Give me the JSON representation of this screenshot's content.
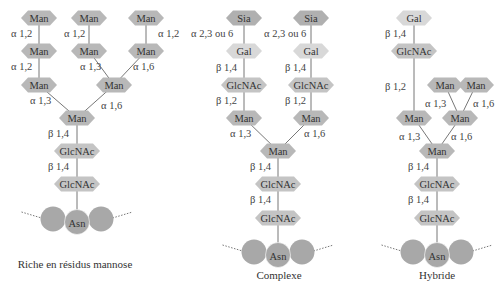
{
  "colors": {
    "man": "#b8b8b8",
    "glcnac": "#c4c4c4",
    "sia": "#b0b0b0",
    "gal": "#d8d8d8",
    "asn": "#a8a8a8",
    "bond": "#777777",
    "text": "#333333"
  },
  "panels": [
    {
      "caption": "Riche en résidus mannose",
      "caption_pos": [
        75,
        268
      ],
      "nodes": [
        {
          "id": "m1",
          "label": "Man",
          "type": "man",
          "x": 39,
          "y": 18
        },
        {
          "id": "m2",
          "label": "Man",
          "type": "man",
          "x": 89,
          "y": 18
        },
        {
          "id": "m3",
          "label": "Man",
          "type": "man",
          "x": 146,
          "y": 18
        },
        {
          "id": "m4",
          "label": "Man",
          "type": "man",
          "x": 39,
          "y": 51
        },
        {
          "id": "m5",
          "label": "Man",
          "type": "man",
          "x": 89,
          "y": 51
        },
        {
          "id": "m6",
          "label": "Man",
          "type": "man",
          "x": 146,
          "y": 51
        },
        {
          "id": "m7",
          "label": "Man",
          "type": "man",
          "x": 39,
          "y": 85
        },
        {
          "id": "m8",
          "label": "Man",
          "type": "man",
          "x": 114,
          "y": 85
        },
        {
          "id": "m9",
          "label": "Man",
          "type": "man",
          "x": 77,
          "y": 118
        },
        {
          "id": "g1",
          "label": "GlcNAc",
          "type": "glcnac",
          "x": 77,
          "y": 151
        },
        {
          "id": "g2",
          "label": "GlcNAc",
          "type": "glcnac",
          "x": 77,
          "y": 184
        }
      ],
      "bonds": [
        {
          "from": "m1",
          "to": "m4",
          "label": "α 1,2",
          "lx": 11,
          "ly": 37
        },
        {
          "from": "m2",
          "to": "m5",
          "label": "α 1,2",
          "lx": 64,
          "ly": 37
        },
        {
          "from": "m3",
          "to": "m6",
          "label": "α 1,2",
          "lx": 158,
          "ly": 37
        },
        {
          "from": "m4",
          "to": "m7",
          "label": "α 1,2",
          "lx": 11,
          "ly": 70
        },
        {
          "from": "m5",
          "to": "m8",
          "label": "α 1,3",
          "lx": 80,
          "ly": 70
        },
        {
          "from": "m6",
          "to": "m8",
          "label": "α 1,6",
          "lx": 133,
          "ly": 70
        },
        {
          "from": "m7",
          "to": "m9",
          "label": "α 1,3",
          "lx": 30,
          "ly": 104
        },
        {
          "from": "m8",
          "to": "m9",
          "label": "α 1,6",
          "lx": 101,
          "ly": 109
        },
        {
          "from": "m9",
          "to": "g1",
          "label": "β 1,4",
          "lx": 48,
          "ly": 137
        },
        {
          "from": "g1",
          "to": "g2",
          "label": "β 1,4",
          "lx": 48,
          "ly": 170
        }
      ],
      "asn": {
        "label": "Asn",
        "x": 77,
        "y": 220,
        "stem_from": "g2"
      }
    },
    {
      "caption": "Complexe",
      "caption_pos": [
        279,
        279
      ],
      "nodes": [
        {
          "id": "s1",
          "label": "Sia",
          "type": "sia",
          "x": 244,
          "y": 18
        },
        {
          "id": "s2",
          "label": "Sia",
          "type": "sia",
          "x": 311,
          "y": 18
        },
        {
          "id": "ga1",
          "label": "Gal",
          "type": "gal",
          "x": 244,
          "y": 51
        },
        {
          "id": "ga2",
          "label": "Gal",
          "type": "gal",
          "x": 311,
          "y": 51
        },
        {
          "id": "gn1",
          "label": "GlcNAc",
          "type": "glcnac",
          "x": 244,
          "y": 85
        },
        {
          "id": "gn2",
          "label": "GlcNAc",
          "type": "glcnac",
          "x": 311,
          "y": 85
        },
        {
          "id": "ma1",
          "label": "Man",
          "type": "man",
          "x": 244,
          "y": 118
        },
        {
          "id": "ma2",
          "label": "Man",
          "type": "man",
          "x": 311,
          "y": 118
        },
        {
          "id": "ma3",
          "label": "Man",
          "type": "man",
          "x": 278,
          "y": 151
        },
        {
          "id": "gc1",
          "label": "GlcNAc",
          "type": "glcnac",
          "x": 278,
          "y": 184
        },
        {
          "id": "gc2",
          "label": "GlcNAc",
          "type": "glcnac",
          "x": 278,
          "y": 218
        }
      ],
      "bonds": [
        {
          "from": "s1",
          "to": "ga1",
          "label": "α 2,3 ou 6",
          "lx": 191,
          "ly": 37
        },
        {
          "from": "s2",
          "to": "ga2",
          "label": "α 2,3 ou 6",
          "lx": 264,
          "ly": 37
        },
        {
          "from": "ga1",
          "to": "gn1",
          "label": "β 1,4",
          "lx": 216,
          "ly": 71
        },
        {
          "from": "ga2",
          "to": "gn2",
          "label": "β 1,4",
          "lx": 285,
          "ly": 71
        },
        {
          "from": "gn1",
          "to": "ma1",
          "label": "β 1,2",
          "lx": 216,
          "ly": 104
        },
        {
          "from": "gn2",
          "to": "ma2",
          "label": "β 1,2",
          "lx": 285,
          "ly": 104
        },
        {
          "from": "ma1",
          "to": "ma3",
          "label": "α 1,3",
          "lx": 230,
          "ly": 137
        },
        {
          "from": "ma2",
          "to": "ma3",
          "label": "α 1,6",
          "lx": 304,
          "ly": 137
        },
        {
          "from": "ma3",
          "to": "gc1",
          "label": "β 1,4",
          "lx": 250,
          "ly": 170
        },
        {
          "from": "gc1",
          "to": "gc2",
          "label": "β 1,4",
          "lx": 250,
          "ly": 203
        }
      ],
      "asn": {
        "label": "Asn",
        "x": 278,
        "y": 253,
        "stem_from": "gc2"
      }
    },
    {
      "caption": "Hybride",
      "caption_pos": [
        437,
        279
      ],
      "nodes": [
        {
          "id": "hg",
          "label": "Gal",
          "type": "gal",
          "x": 414,
          "y": 18
        },
        {
          "id": "hgn",
          "label": "GlcNAc",
          "type": "glcnac",
          "x": 414,
          "y": 51
        },
        {
          "id": "hm1",
          "label": "Man",
          "type": "man",
          "x": 445,
          "y": 85
        },
        {
          "id": "hm2",
          "label": "Man",
          "type": "man",
          "x": 476,
          "y": 85
        },
        {
          "id": "hm3",
          "label": "Man",
          "type": "man",
          "x": 414,
          "y": 118
        },
        {
          "id": "hm4",
          "label": "Man",
          "type": "man",
          "x": 460,
          "y": 118
        },
        {
          "id": "hm5",
          "label": "Man",
          "type": "man",
          "x": 437,
          "y": 151
        },
        {
          "id": "hc1",
          "label": "GlcNAc",
          "type": "glcnac",
          "x": 437,
          "y": 184
        },
        {
          "id": "hc2",
          "label": "GlcNAc",
          "type": "glcnac",
          "x": 437,
          "y": 218
        }
      ],
      "bonds": [
        {
          "from": "hg",
          "to": "hgn",
          "label": "β 1,4",
          "lx": 385,
          "ly": 37
        },
        {
          "from": "hgn",
          "to": "hm3",
          "label": "β 1,2",
          "lx": 385,
          "ly": 90
        },
        {
          "from": "hm1",
          "to": "hm4",
          "label": "α 1,3",
          "lx": 425,
          "ly": 107
        },
        {
          "from": "hm2",
          "to": "hm4",
          "label": "α 1,6",
          "lx": 473,
          "ly": 107
        },
        {
          "from": "hm3",
          "to": "hm5",
          "label": "α 1,3",
          "lx": 399,
          "ly": 140
        },
        {
          "from": "hm4",
          "to": "hm5",
          "label": "α 1,6",
          "lx": 451,
          "ly": 140
        },
        {
          "from": "hm5",
          "to": "hc1",
          "label": "β 1,4",
          "lx": 408,
          "ly": 170
        },
        {
          "from": "hc1",
          "to": "hc2",
          "label": "β 1,4",
          "lx": 408,
          "ly": 203
        }
      ],
      "asn": {
        "label": "Asn",
        "x": 437,
        "y": 253,
        "stem_from": "hc2"
      }
    }
  ]
}
